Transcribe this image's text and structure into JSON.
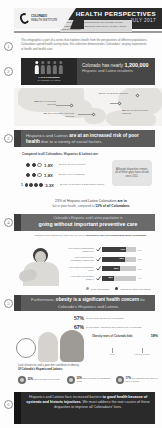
{
  "header": {
    "logo_line1": "COLORADO",
    "logo_line2": "HEALTH INSTITUTE",
    "title": "HEALTH PERSPECTIVES",
    "date": "JULY 2017"
  },
  "intro": {
    "number": "1",
    "text": "This infographic is part of a series that explores health from the perspectives of different populations. Coloradans spend health survey data, this collection demonstrates Coloradans' varying experiences of health and health care."
  },
  "section2": {
    "number": "2",
    "people_total": 5,
    "people_highlighted": 1,
    "people_caption": "1 in 5 Coloradans",
    "people_caption_sub": "is Hispanic or Latino",
    "headline_pre": "Colorado has nearly",
    "headline_number": "1,200,000",
    "headline_sub": "Hispanic and Latino residents",
    "note": "Hispanic and Latino Coloradans trace their heritage to many countries. The largest shares are from Mexico, Central America and the Caribbean.",
    "map_labels": [
      {
        "value": "73%",
        "text": "are of Mexican descent"
      },
      {
        "value": "7%",
        "text": "are of Central American descent"
      },
      {
        "value": "4%",
        "text": "are of Spanish descent"
      },
      {
        "value": "3%",
        "text": "are of Puerto Rican descent"
      }
    ]
  },
  "section3": {
    "number": "3",
    "banner_pre": "Hispanics and Latinos",
    "banner_bold": "are at an increased risk of poor health",
    "banner_post": "due to a variety of social factors.",
    "caption": "Compared to all Coloradans, Hispanics & Latinos are:",
    "stats": [
      {
        "multiplier": "1.8X",
        "label": "as likely to live in poverty",
        "filled": 2,
        "total": 3
      },
      {
        "multiplier": "1.8X",
        "label": "as likely to be uninsured",
        "filled": 2,
        "total": 3
      },
      {
        "multiplier": "3.3X",
        "label": "as likely to not have a high school degree",
        "filled": 1,
        "total": 5
      }
    ],
    "callout": "Although disparities remain, all of these gaps have shrunk since 2011.",
    "bigstat_line1_pre": "23% of Hispanic and Latino Coloradans",
    "bigstat_line1_bold": "are in",
    "bigstat_line2_pre": "fair or poor health, compared to",
    "bigstat_line2_bold": "13% of all Coloradans"
  },
  "section4": {
    "number": "4",
    "banner_line1": "Colorado's Hispanic and Latino population is",
    "banner_line2": "going without important preventive care",
    "caption_pre": "Hispanics and Latinos are less likely to receive",
    "caption_bold": "preventive care screenings than white Coloradans",
    "bars": [
      {
        "label": "Have had a mammogram (past 2 yrs)",
        "value": "71%",
        "compare": "80%",
        "pct": 71
      },
      {
        "label": "Have checked their cholesterol (past 5 yrs)",
        "value": "68%",
        "compare": "78%",
        "pct": 68
      },
      {
        "label": "Have had a colonoscopy (ever)",
        "value": "52%",
        "compare": "67%",
        "pct": 52
      },
      {
        "label": "Have had a flu vaccine (past yr)",
        "value": "35%",
        "compare": "44%",
        "pct": 35
      }
    ],
    "legend": [
      {
        "label": "White Coloradans",
        "color": "#9e9e9e"
      },
      {
        "label": "Hispanic & Latino Coloradans",
        "color": "#3d3d3d"
      }
    ]
  },
  "section5": {
    "number": "5",
    "banner_pre": "Furthermore,",
    "banner_bold": "obesity is a significant health concern",
    "banner_post": "for Colorado's Hispanics and Latinos",
    "overweight": [
      {
        "value": "57%",
        "text": "of Colorado adults are overweight"
      },
      {
        "value": "67%",
        "text": "of Colorado Hispanics and Latinos are overweight"
      }
    ],
    "obesity_rate_label": "Obesity rates of Colorado kids",
    "obesity_rate_value": "18%",
    "tick_labels": [
      "White",
      "Hispanic & Latino"
    ],
    "diet_caption_line1": "Lack of exercise and a poor diet contribute to obesity.",
    "diet_caption_line2": "Of Colorado's Hispanic and Latinos:",
    "diet_items": [
      {
        "value": "32%",
        "text": "eat 1 serving of fruit a day"
      },
      {
        "value": "32%",
        "text": "eat 1 serving of vegetables a day"
      },
      {
        "value": "17%",
        "text": "are less than one hour of daily exercise"
      }
    ]
  },
  "section6": {
    "number": "6",
    "text_pre": "Hispanics and Latinos face increased barriers",
    "text_bold": "to good health because of systemic and historic injustices.",
    "text_post": "We must address the root causes of these disparities to improve all Coloradans' lives."
  },
  "colors": {
    "dark": "#2b2b2b",
    "mid": "#5b5b5b",
    "light_gray": "#c9c9c9",
    "accent": "#474747"
  }
}
